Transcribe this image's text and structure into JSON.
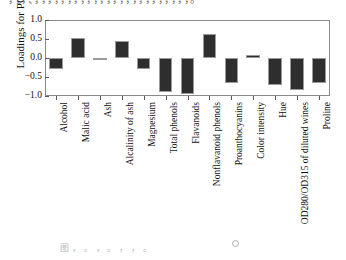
{
  "page": {
    "top_scan_text": "，，，、，，，，，，，，，，，，，，，，，，，，，，，，。",
    "caption_text": "图 ， 。 ，  。 ，  ，  。",
    "bar_color": "#2e2e2e",
    "frame_color": "#8a8a8a"
  },
  "chart_data": {
    "type": "bar",
    "title": "",
    "xlabel": "",
    "ylabel": "Loadings for PC 1",
    "ylim": [
      -1.0,
      1.0
    ],
    "yticks": [
      "1.0",
      "0.5",
      "0.0",
      "-0.5",
      "-1.0"
    ],
    "ytick_values": [
      1.0,
      0.5,
      0.0,
      -0.5,
      -1.0
    ],
    "grid": false,
    "legend": "none",
    "categories": [
      "Alcohol",
      "Malic acid",
      "Ash",
      "Alcalinity of ash",
      "Magnesium",
      "Total phenols",
      "Flavanoids",
      "Nonflavanoid phenols",
      "Proanthocyanins",
      "Color intensity",
      "Hue",
      "OD280/OD315 of diluted wines",
      "Proline"
    ],
    "values": [
      -0.28,
      0.52,
      -0.03,
      0.44,
      -0.29,
      -0.89,
      -0.94,
      0.63,
      -0.67,
      0.09,
      -0.72,
      -0.83,
      -0.65
    ]
  }
}
